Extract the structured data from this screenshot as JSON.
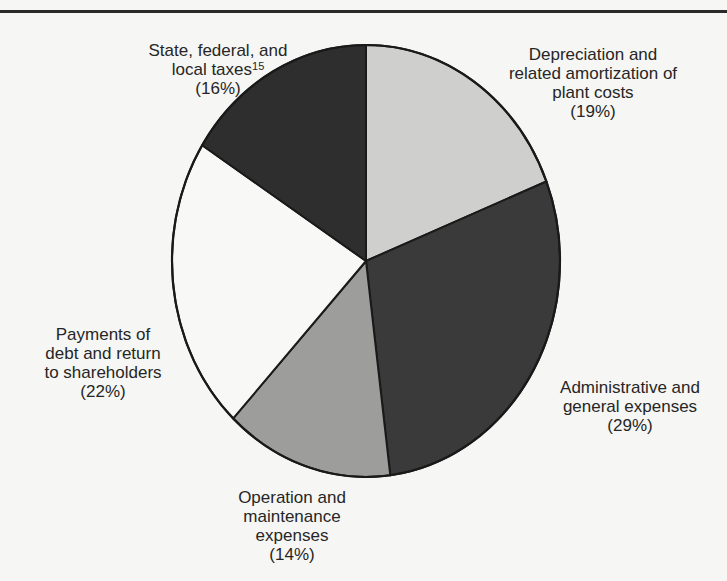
{
  "chart_data": {
    "type": "pie",
    "title": "",
    "start_angle_deg": 0,
    "direction": "clockwise",
    "slices": [
      {
        "label": "Depreciation and related amortization of plant costs",
        "value": 19,
        "percent_label": "(19%)",
        "color": "#cfcfcd"
      },
      {
        "label": "Administrative and general expenses",
        "value": 29,
        "percent_label": "(29%)",
        "color": "#3a3a3a"
      },
      {
        "label": "Operation and maintenance expenses",
        "value": 14,
        "percent_label": "(14%)",
        "color": "#9d9d9b"
      },
      {
        "label": "Payments of debt and return to shareholders",
        "value": 22,
        "percent_label": "(22%)",
        "color": "#f8f8f6"
      },
      {
        "label": "State, federal, and local taxes",
        "footnote": "15",
        "value": 16,
        "percent_label": "(16%)",
        "color": "#2e2e2e"
      }
    ],
    "units": "percent"
  },
  "labels": {
    "depreciation": {
      "line1": "Depreciation and",
      "line2": "related amortization of",
      "line3": "plant costs",
      "pct": "(19%)"
    },
    "administrative": {
      "line1": "Administrative and",
      "line2": "general expenses",
      "pct": "(29%)"
    },
    "operation": {
      "line1": "Operation and",
      "line2": "maintenance",
      "line3": "expenses",
      "pct": "(14%)"
    },
    "payments": {
      "line1": "Payments of",
      "line2": "debt and return",
      "line3": "to shareholders",
      "pct": "(22%)"
    },
    "taxes": {
      "line1": "State, federal, and",
      "line2": "local taxes",
      "footnote": "15",
      "pct": "(16%)"
    }
  }
}
